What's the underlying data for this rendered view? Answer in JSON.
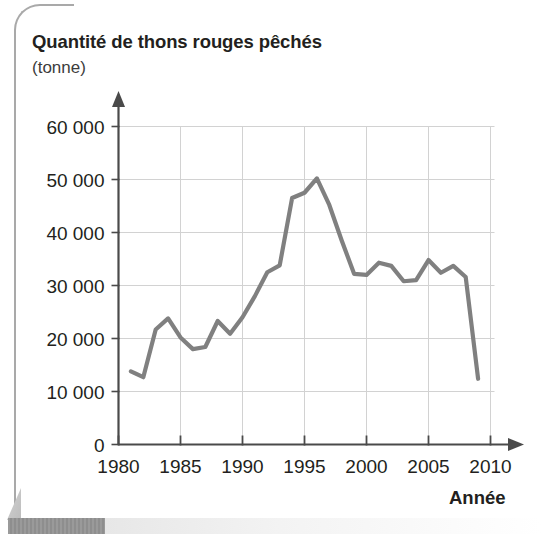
{
  "chart_data": {
    "type": "line",
    "title": "Quantité de thons rouges pêchés",
    "subtitle": "(tonne)",
    "xlabel": "Année",
    "ylabel": "(tonne)",
    "xlim": [
      1980,
      2010
    ],
    "ylim": [
      0,
      60000
    ],
    "grid": true,
    "legend": null,
    "line_color": "#808080",
    "axis_color": "#4a4a4a",
    "grid_color": "#d2d2d2",
    "y_ticks": [
      0,
      10000,
      20000,
      30000,
      40000,
      50000,
      60000
    ],
    "y_tick_labels": [
      "0",
      "10 000",
      "20 000",
      "30 000",
      "40 000",
      "50 000",
      "60 000"
    ],
    "x_ticks": [
      1980,
      1985,
      1990,
      1995,
      2000,
      2005,
      2010
    ],
    "x_tick_labels": [
      "1980",
      "1985",
      "1990",
      "1995",
      "2000",
      "2005",
      "2010"
    ],
    "x": [
      1981,
      1982,
      1983,
      1984,
      1985,
      1986,
      1987,
      1988,
      1989,
      1990,
      1991,
      1992,
      1993,
      1994,
      1995,
      1996,
      1997,
      1998,
      1999,
      2000,
      2001,
      2002,
      2003,
      2004,
      2005,
      2006,
      2007,
      2008,
      2009
    ],
    "values": [
      13800,
      12700,
      21700,
      23800,
      20200,
      18000,
      18400,
      23300,
      20900,
      24000,
      28000,
      32500,
      33800,
      46500,
      47500,
      50200,
      45200,
      38500,
      32200,
      32000,
      34300,
      33700,
      30800,
      31000,
      34800,
      32400,
      33700,
      31600,
      12400
    ],
    "series": [
      {
        "name": "Quantité de thons rouges pêchés",
        "values": [
          13800,
          12700,
          21700,
          23800,
          20200,
          18000,
          18400,
          23300,
          20900,
          24000,
          28000,
          32500,
          33800,
          46500,
          47500,
          50200,
          45200,
          38500,
          32200,
          32000,
          34300,
          33700,
          30800,
          31000,
          34800,
          32400,
          33700,
          31600,
          12400
        ]
      }
    ]
  }
}
